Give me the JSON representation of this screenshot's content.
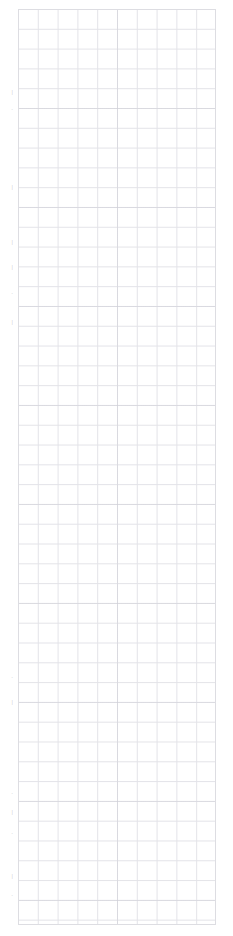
{
  "page": {
    "kind": "graph-paper-sheet",
    "background_color": "#ffffff",
    "width_px": 233,
    "height_px": 936,
    "visible_text": ""
  },
  "grid": {
    "label": "graph paper grid",
    "left_px": 18,
    "top_px": 9,
    "width_px": 198,
    "height_px": 916,
    "cell_size_px": 19.8,
    "columns": 10,
    "rows": 46,
    "line_color": "#e3e3e8",
    "major_line_color": "#c8c8d0",
    "major_every": 5,
    "border_color": "#dddde2"
  },
  "margin": {
    "label": "left margin clipped text",
    "fragments": [
      {
        "text": "|",
        "top_px": 88
      },
      {
        "text": ".",
        "top_px": 104
      },
      {
        "text": "|",
        "top_px": 183
      },
      {
        "text": "|",
        "top_px": 238
      },
      {
        "text": "|",
        "top_px": 263
      },
      {
        "text": ".",
        "top_px": 288
      },
      {
        "text": "|",
        "top_px": 318
      },
      {
        "text": ".",
        "top_px": 672
      },
      {
        "text": "|",
        "top_px": 698
      },
      {
        "text": ".",
        "top_px": 788
      },
      {
        "text": "|",
        "top_px": 808
      },
      {
        "text": ".",
        "top_px": 828
      },
      {
        "text": "|",
        "top_px": 872
      },
      {
        "text": ".",
        "top_px": 890
      }
    ]
  }
}
